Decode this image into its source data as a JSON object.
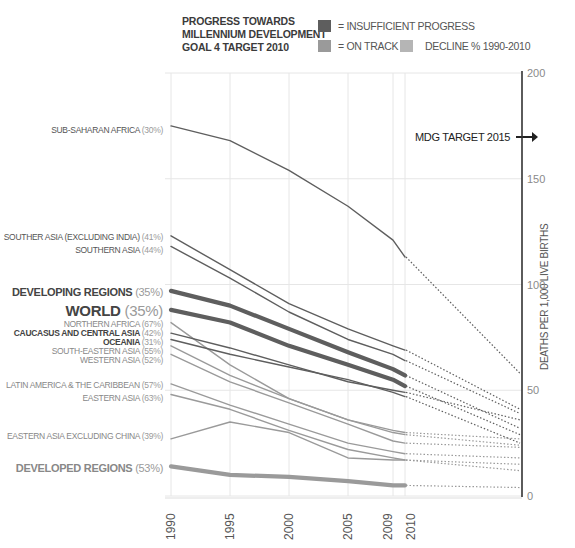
{
  "legend": {
    "title_lines": [
      "PROGRESS TOWARDS",
      "MILLENNIUM DEVELOPMENT",
      "GOAL 4 TARGET 2010"
    ],
    "items": [
      {
        "label": "= INSUFFICIENT PROGRESS",
        "color": "#5e5e5e"
      },
      {
        "label": "= ON TRACK",
        "color": "#9a9a9a"
      },
      {
        "label": "DECLINE % 1990-2010",
        "color": "#b5b5b5"
      }
    ]
  },
  "annotation": {
    "mdg_target": "MDG TARGET 2015",
    "mdg_target_value": 170
  },
  "colors": {
    "insufficient": "#5e5e5e",
    "on_track": "#9a9a9a",
    "decline_pct": "#aaaaaa",
    "grid": "#e6e6e6",
    "axis": "#333333"
  },
  "chart_data": {
    "type": "line",
    "title": "PROGRESS TOWARDS MILLENNIUM DEVELOPMENT GOAL 4 TARGET 2010",
    "xlabel": "",
    "ylabel": "DEATHS PER 1,000 LIVE BIRTHS",
    "x": [
      1990,
      1995,
      2000,
      2005,
      2009,
      2010
    ],
    "x_tick_labels": [
      "1990",
      "1995",
      "2000",
      "2005",
      "2009",
      "2010"
    ],
    "y_ticks": [
      0,
      50,
      100,
      150,
      200
    ],
    "y_tick_labels": [
      "0",
      "50",
      "100",
      "150",
      "200"
    ],
    "ylim": [
      0,
      200
    ],
    "projection_year": 2015,
    "grid": true,
    "y_axis_position": "right",
    "legend_position": "top",
    "series": [
      {
        "name": "SUB-SAHARAN AFRICA",
        "decline": "(30%)",
        "status": "insufficient",
        "emphasis": "normal",
        "values": [
          175,
          168,
          154,
          137,
          121,
          113
        ],
        "projection_2015": 58
      },
      {
        "name": "SOUTHER ASIA (EXCLUDING INDIA)",
        "decline": "(41%)",
        "status": "insufficient",
        "emphasis": "normal",
        "values": [
          123,
          107,
          91,
          79,
          71,
          69
        ],
        "projection_2015": 41
      },
      {
        "name": "SOUTHERN ASIA",
        "decline": "(44%)",
        "status": "insufficient",
        "emphasis": "normal",
        "values": [
          118,
          103,
          87,
          74,
          67,
          64
        ],
        "projection_2015": 39
      },
      {
        "name": "DEVELOPING REGIONS",
        "decline": "(35%)",
        "status": "insufficient",
        "emphasis": "bold",
        "values": [
          97,
          90,
          79,
          68,
          60,
          57
        ],
        "projection_2015": 32
      },
      {
        "name": "WORLD",
        "decline": "(35%)",
        "status": "insufficient",
        "emphasis": "large",
        "values": [
          88,
          82,
          71,
          62,
          55,
          52
        ],
        "projection_2015": 29
      },
      {
        "name": "NORTHERN AFRICA",
        "decline": "(67%)",
        "status": "on_track",
        "emphasis": "normal",
        "values": [
          82,
          62,
          46,
          36,
          31,
          30
        ],
        "projection_2015": 27
      },
      {
        "name": "CAUCASUS AND CENTRAL ASIA",
        "decline": "(42%)",
        "status": "insufficient",
        "emphasis": "normal",
        "values": [
          77,
          70,
          62,
          54,
          50,
          49
        ],
        "projection_2015": 36
      },
      {
        "name": "OCEANIA",
        "decline": "(31%)",
        "status": "insufficient",
        "emphasis": "normal",
        "values": [
          74,
          67,
          61,
          55,
          49,
          47
        ],
        "projection_2015": 25
      },
      {
        "name": "SOUTH-EASTERN ASIA",
        "decline": "(55%)",
        "status": "on_track",
        "emphasis": "normal",
        "values": [
          71,
          57,
          46,
          36,
          30,
          29
        ],
        "projection_2015": 24
      },
      {
        "name": "WESTERN ASIA",
        "decline": "(52%)",
        "status": "on_track",
        "emphasis": "normal",
        "values": [
          67,
          54,
          44,
          34,
          26,
          25
        ],
        "projection_2015": 23
      },
      {
        "name": "LATIN AMERICA & THE CARIBBEAN",
        "decline": "(57%)",
        "status": "on_track",
        "emphasis": "normal",
        "values": [
          53,
          43,
          34,
          25,
          21,
          20
        ],
        "projection_2015": 18
      },
      {
        "name": "EASTERN ASIA",
        "decline": "(63%)",
        "status": "on_track",
        "emphasis": "normal",
        "values": [
          48,
          41,
          31,
          22,
          18,
          17
        ],
        "projection_2015": 15
      },
      {
        "name": "EASTERN ASIA EXCLUDING CHINA",
        "decline": "(39%)",
        "status": "on_track",
        "emphasis": "normal",
        "values": [
          27,
          35,
          30,
          18,
          17,
          17
        ],
        "projection_2015": 12
      },
      {
        "name": "DEVELOPED REGIONS",
        "decline": "(53%)",
        "status": "on_track",
        "emphasis": "bold",
        "values": [
          14,
          10,
          9,
          7,
          5,
          5
        ],
        "projection_2015": 4
      }
    ]
  }
}
